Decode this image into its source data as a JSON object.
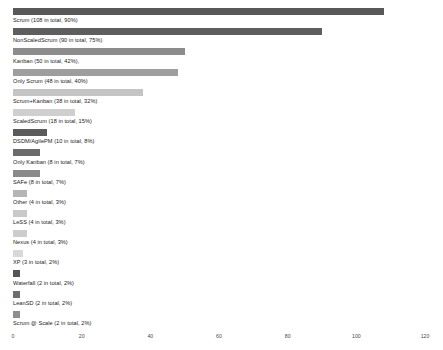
{
  "chart_data": {
    "type": "bar",
    "orientation": "horizontal",
    "title": "",
    "xlabel": "",
    "ylabel": "",
    "xlim": [
      0,
      120
    ],
    "grid": false,
    "legend": null,
    "xticks": [
      "0",
      "20",
      "40",
      "60",
      "80",
      "100",
      "120"
    ],
    "categories": [
      "Scrum",
      "NonScaledScrum",
      "Kanban",
      "Only Scrum",
      "Scrum+Kanban",
      "ScaledScrum",
      "DSDM/AgilePM",
      "Only Kanban",
      "SAFe",
      "Other",
      "LeSS",
      "Nexus",
      "XP",
      "Waterfall",
      "LeanSD",
      "Scrum @ Scale"
    ],
    "values": [
      108,
      90,
      50,
      48,
      38,
      18,
      10,
      8,
      8,
      4,
      4,
      4,
      3,
      2,
      2,
      2
    ],
    "percents": [
      "90%",
      "75%",
      "42%",
      "40%",
      "32%",
      "15%",
      "8%",
      "7%",
      "7%",
      "3%",
      "3%",
      "3%",
      "2%",
      "2%",
      "2%",
      "2%"
    ],
    "bars": [
      {
        "label": "Scrum (108 in total, 90%)",
        "value": 108,
        "color": "#595959"
      },
      {
        "label": "NonScaledScrum (90 in total, 75%)",
        "value": 90,
        "color": "#5e5e5e"
      },
      {
        "label": "Kanban (50 in total, 42%),",
        "value": 50,
        "color": "#8c8c8c"
      },
      {
        "label": "Only Scrum (48 in total, 40%)",
        "value": 48,
        "color": "#9e9e9e"
      },
      {
        "label": "Scrum+Kanban (38 in total, 32%)",
        "value": 38,
        "color": "#c4c4c4"
      },
      {
        "label": "ScaledScrum (18 in total, 15%)",
        "value": 18,
        "color": "#cfcfcf"
      },
      {
        "label": "DSDM/AgilePM (10 in total, 8%)",
        "value": 10,
        "color": "#5a5a5a"
      },
      {
        "label": "Only Kanban (8 in total, 7%)",
        "value": 8,
        "color": "#6b6b6b"
      },
      {
        "label": "SAFe (8 in total, 7%)",
        "value": 8,
        "color": "#8a8a8a"
      },
      {
        "label": "Other (4 in total, 3%)",
        "value": 4,
        "color": "#b5b5b5"
      },
      {
        "label": "LeSS (4 in total, 3%)",
        "value": 4,
        "color": "#c9c9c9"
      },
      {
        "label": "Nexus (4 in total, 3%)",
        "value": 4,
        "color": "#cccccc"
      },
      {
        "label": "XP (3 in total, 2%)",
        "value": 3,
        "color": "#d8d8d8"
      },
      {
        "label": "Waterfall (2 in total, 2%)",
        "value": 2,
        "color": "#555555"
      },
      {
        "label": "LeanSD (2 in total, 2%)",
        "value": 2,
        "color": "#6e6e6e"
      },
      {
        "label": "Scrum @ Scale (2 in total, 2%)",
        "value": 2,
        "color": "#8f8f8f"
      }
    ]
  }
}
